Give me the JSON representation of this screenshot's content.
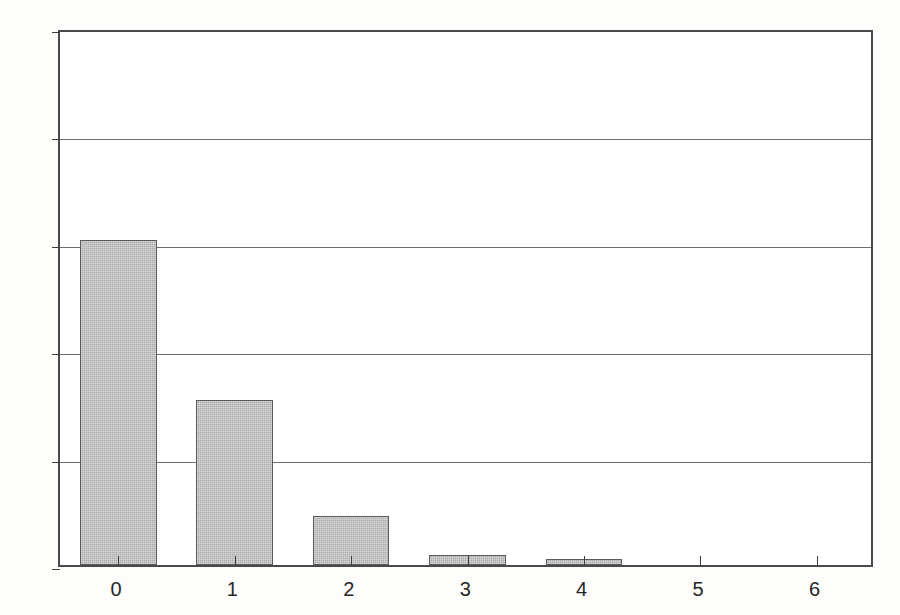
{
  "chart_data": {
    "type": "bar",
    "title": "",
    "subtitle": "",
    "xlabel": "",
    "ylabel": "",
    "categories": [
      "0",
      "1",
      "2",
      "3",
      "4",
      "5",
      "6"
    ],
    "values": [
      0.605,
      0.308,
      0.092,
      0.019,
      0.011,
      0.001,
      0.0
    ],
    "series": [
      {
        "name": "",
        "values": [
          0.605,
          0.308,
          0.092,
          0.019,
          0.011,
          0.001,
          0.0
        ]
      }
    ],
    "xlim": [
      -0.5,
      6.5
    ],
    "ylim": [
      0,
      1
    ],
    "ytick_labels": [
      "0",
      "0.2",
      "0.4",
      "0.6",
      "0.8",
      "1"
    ],
    "ytick_values": [
      0,
      0.2,
      0.4,
      0.6,
      0.8,
      1
    ],
    "xtick_labels": [
      "0",
      "1",
      "2",
      "3",
      "4",
      "5",
      "6"
    ],
    "xtick_values": [
      0,
      1,
      2,
      3,
      4,
      5,
      6
    ],
    "grid": "horizontal",
    "legend": "none",
    "annotations": [],
    "colors": {
      "bar_fill": "#adadad",
      "bar_border": "#5a5a5a",
      "grid": "#6e6e6e",
      "axis": "#4a4a4a",
      "text": "#262626",
      "background": "#fdfdfc",
      "plot_background": "#ffffff"
    }
  }
}
